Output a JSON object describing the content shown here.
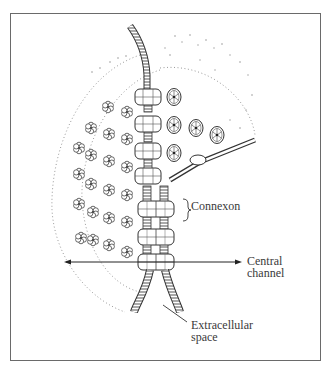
{
  "figure": {
    "labels": {
      "connexon": "Connexon",
      "central_channel": [
        "Central",
        "channel"
      ],
      "extracellular_space": [
        "Extracellular",
        "space"
      ]
    },
    "colors": {
      "frame": "#6a6a6a",
      "line": "#3a3a3a",
      "stipple": "#9a9a9a",
      "background": "#ffffff"
    }
  }
}
